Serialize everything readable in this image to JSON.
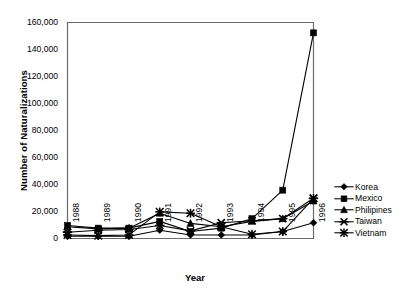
{
  "chart_data": {
    "type": "line",
    "title": "",
    "xlabel": "Year",
    "ylabel": "Number of Naturalizations",
    "categories": [
      "1988",
      "1989",
      "1990",
      "1991",
      "1992",
      "1993",
      "1994",
      "1995",
      "1996"
    ],
    "ylim": [
      0,
      160000
    ],
    "yticks": [
      0,
      20000,
      40000,
      60000,
      80000,
      100000,
      120000,
      140000,
      160000
    ],
    "ytick_labels": [
      "0",
      "20,000",
      "40,000",
      "60,000",
      "80,000",
      "100,000",
      "120,000",
      "140,000",
      "160,000"
    ],
    "grid": false,
    "legend_position": "right",
    "series": [
      {
        "name": "Korea",
        "marker": "diamond",
        "color": "#000000",
        "values": [
          2000,
          2000,
          2000,
          6500,
          3000,
          3000,
          3000,
          5500,
          12000
        ]
      },
      {
        "name": "Mexico",
        "marker": "square",
        "color": "#000000",
        "values": [
          10000,
          8000,
          8000,
          13000,
          5500,
          8000,
          15000,
          36000,
          152000
        ]
      },
      {
        "name": "Philipines",
        "marker": "triangle",
        "color": "#000000",
        "values": [
          9000,
          7500,
          8000,
          19000,
          11500,
          9000,
          13000,
          15000,
          28000
        ]
      },
      {
        "name": "Taiwan",
        "marker": "cross-bar",
        "color": "#000000",
        "values": [
          5000,
          6500,
          7000,
          10000,
          6000,
          12000,
          13500,
          15000,
          30000
        ]
      },
      {
        "name": "Vietnam",
        "marker": "asterisk",
        "color": "#000000",
        "values": [
          3000,
          2500,
          3000,
          20000,
          19000,
          9000,
          3500,
          5500,
          30000
        ]
      }
    ]
  },
  "legend": {
    "items": [
      {
        "label": "Korea",
        "marker": "diamond-marker"
      },
      {
        "label": "Mexico",
        "marker": "square-marker"
      },
      {
        "label": "Philipines",
        "marker": "triangle-marker"
      },
      {
        "label": "Taiwan",
        "marker": "cross-bar-marker"
      },
      {
        "label": "Vietnam",
        "marker": "asterisk-marker"
      }
    ]
  },
  "axes": {
    "y_title": "Number of Naturalizations",
    "x_title": "Year",
    "y_tick_labels": [
      "160,000",
      "140,000",
      "120,000",
      "100,000",
      "80,000",
      "60,000",
      "40,000",
      "20,000",
      "0"
    ],
    "x_tick_labels": [
      "1988",
      "1989",
      "1990",
      "1991",
      "1992",
      "1993",
      "1994",
      "1995",
      "1996"
    ]
  },
  "colors": {
    "axis": "#6b6b6b",
    "series": "#000000",
    "background": "#ffffff"
  }
}
